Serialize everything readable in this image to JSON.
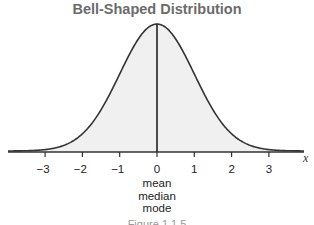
{
  "chart_data": {
    "type": "line",
    "title": "Bell-Shaped Distribution",
    "xlabel": "x",
    "ylabel": "",
    "xlim": [
      -4,
      4
    ],
    "x_ticks": [
      -3,
      -2,
      -1,
      0,
      1,
      2,
      3
    ],
    "tick_labels": [
      "−3",
      "−2",
      "−1",
      "0",
      "1",
      "2",
      "3"
    ],
    "series": [
      {
        "name": "normal curve",
        "mean": 0,
        "sd": 1
      }
    ],
    "annotations": [
      "mean",
      "median",
      "mode"
    ],
    "fill": "#f0f0f0",
    "grid": false
  },
  "caption": "Figure 1.1.5"
}
